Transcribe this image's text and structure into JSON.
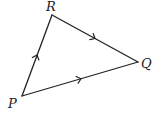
{
  "diagram": {
    "type": "triangle-vectors",
    "stroke_color": "#222222",
    "background": "#ffffff",
    "vertices": [
      {
        "id": "P",
        "label": "P",
        "x": 22,
        "y": 96,
        "label_x": 8,
        "label_y": 108
      },
      {
        "id": "R",
        "label": "R",
        "x": 52,
        "y": 15,
        "label_x": 46,
        "label_y": 11
      },
      {
        "id": "Q",
        "label": "Q",
        "x": 138,
        "y": 62,
        "label_x": 141,
        "label_y": 68
      }
    ],
    "edges": [
      {
        "from": "P",
        "to": "R",
        "direction": "P→R",
        "arrows": 1
      },
      {
        "from": "R",
        "to": "Q",
        "direction": "R→Q",
        "arrows": 1
      },
      {
        "from": "P",
        "to": "Q",
        "direction": "P→Q",
        "arrows": 1
      }
    ]
  }
}
